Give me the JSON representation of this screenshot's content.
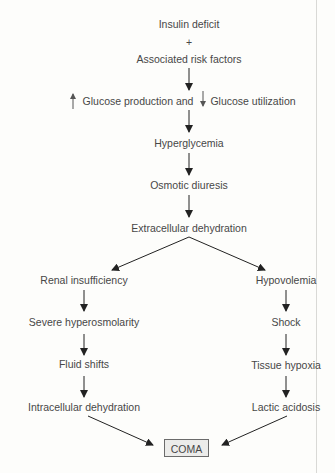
{
  "diagram": {
    "nodes": {
      "insulin_deficit": "Insulin deficit",
      "plus": "+",
      "risk_factors": "Associated risk factors",
      "glucose_production": "Glucose production and",
      "glucose_utilization": "Glucose utilization",
      "hyperglycemia": "Hyperglycemia",
      "osmotic_diuresis": "Osmotic diuresis",
      "extracellular_dehydration": "Extracellular dehydration",
      "renal_insufficiency": "Renal insufficiency",
      "severe_hyperosmolarity": "Severe hyperosmolarity",
      "fluid_shifts": "Fluid shifts",
      "intracellular_dehydration": "Intracellular dehydration",
      "hypovolemia": "Hypovolemia",
      "shock": "Shock",
      "tissue_hypoxia": "Tissue hypoxia",
      "lactic_acidosis": "Lactic acidosis",
      "coma": "COMA"
    },
    "icons": {
      "increase": "up-arrow-icon",
      "decrease": "down-arrow-icon"
    },
    "edges": [
      [
        "Insulin deficit + Associated risk factors",
        "Glucose production and Glucose utilization"
      ],
      [
        "Glucose production and Glucose utilization",
        "Hyperglycemia"
      ],
      [
        "Hyperglycemia",
        "Osmotic diuresis"
      ],
      [
        "Osmotic diuresis",
        "Extracellular dehydration"
      ],
      [
        "Extracellular dehydration",
        "Renal insufficiency"
      ],
      [
        "Extracellular dehydration",
        "Hypovolemia"
      ],
      [
        "Renal insufficiency",
        "Severe hyperosmolarity"
      ],
      [
        "Severe hyperosmolarity",
        "Fluid shifts"
      ],
      [
        "Fluid shifts",
        "Intracellular dehydration"
      ],
      [
        "Intracellular dehydration",
        "COMA"
      ],
      [
        "Hypovolemia",
        "Shock"
      ],
      [
        "Shock",
        "Tissue hypoxia"
      ],
      [
        "Tissue hypoxia",
        "Lactic acidosis"
      ],
      [
        "Lactic acidosis",
        "COMA"
      ]
    ]
  }
}
